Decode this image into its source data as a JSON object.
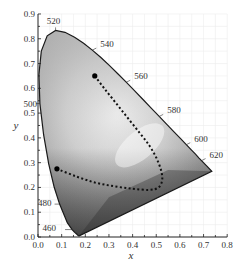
{
  "chart_data": {
    "type": "scatter",
    "title": "",
    "subtitle": "CIE 1931 chromaticity diagram with Planckian-like dotted trajectory",
    "xlabel": "x",
    "ylabel": "y",
    "xlim": [
      0.0,
      0.8
    ],
    "ylim": [
      0.0,
      0.9
    ],
    "xticks": [
      "0.0",
      "0.1",
      "0.2",
      "0.3",
      "0.4",
      "0.5",
      "0.6",
      "0.7",
      "0.8"
    ],
    "yticks": [
      "0.0",
      "0.1",
      "0.2",
      "0.3",
      "0.4",
      "0.5",
      "0.6",
      "0.7",
      "0.8",
      "0.9"
    ],
    "grid": true,
    "legend": null,
    "spectral_locus": {
      "name": "Spectral locus",
      "x": [
        0.1741,
        0.1738,
        0.1733,
        0.1726,
        0.1714,
        0.1689,
        0.1644,
        0.1566,
        0.144,
        0.1241,
        0.0913,
        0.0687,
        0.0454,
        0.0235,
        0.0082,
        0.0039,
        0.0139,
        0.0389,
        0.0743,
        0.1142,
        0.1547,
        0.1929,
        0.2296,
        0.2658,
        0.3016,
        0.3373,
        0.3731,
        0.4087,
        0.4441,
        0.4788,
        0.5125,
        0.5448,
        0.5752,
        0.6029,
        0.627,
        0.6482,
        0.6658,
        0.6801,
        0.6915,
        0.7006,
        0.714,
        0.7347
      ],
      "y": [
        0.005,
        0.0049,
        0.0048,
        0.0048,
        0.0051,
        0.0069,
        0.0109,
        0.0177,
        0.0297,
        0.0578,
        0.1327,
        0.2007,
        0.295,
        0.4127,
        0.5384,
        0.6548,
        0.7502,
        0.812,
        0.8338,
        0.8262,
        0.8059,
        0.7816,
        0.7543,
        0.7243,
        0.6923,
        0.6589,
        0.6245,
        0.5896,
        0.5547,
        0.5202,
        0.4866,
        0.4544,
        0.4242,
        0.3965,
        0.3725,
        0.3514,
        0.334,
        0.3197,
        0.3083,
        0.2993,
        0.2859,
        0.2653
      ]
    },
    "wavelength_labels": [
      {
        "label": "460",
        "x": 0.144,
        "y": 0.03
      },
      {
        "label": "480",
        "x": 0.0913,
        "y": 0.1327
      },
      {
        "label": "500",
        "x": 0.0082,
        "y": 0.5384
      },
      {
        "label": "520",
        "x": 0.0743,
        "y": 0.8338
      },
      {
        "label": "540",
        "x": 0.2296,
        "y": 0.7543
      },
      {
        "label": "560",
        "x": 0.3731,
        "y": 0.6245
      },
      {
        "label": "580",
        "x": 0.5125,
        "y": 0.4866
      },
      {
        "label": "600",
        "x": 0.627,
        "y": 0.3725
      },
      {
        "label": "620",
        "x": 0.6915,
        "y": 0.3083
      }
    ],
    "series": [
      {
        "name": "dotted trajectory",
        "style": "dotted",
        "x": [
          0.24,
          0.28,
          0.33,
          0.38,
          0.43,
          0.47,
          0.5,
          0.52,
          0.525,
          0.51,
          0.47,
          0.4,
          0.32,
          0.24,
          0.16,
          0.08
        ],
        "y": [
          0.65,
          0.6,
          0.54,
          0.48,
          0.42,
          0.37,
          0.32,
          0.27,
          0.23,
          0.2,
          0.19,
          0.195,
          0.205,
          0.22,
          0.245,
          0.275
        ]
      }
    ],
    "markers": [
      {
        "name": "start point",
        "x": 0.24,
        "y": 0.65
      },
      {
        "name": "end point",
        "x": 0.08,
        "y": 0.275
      }
    ]
  }
}
